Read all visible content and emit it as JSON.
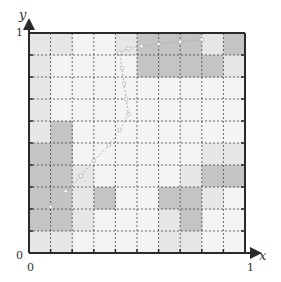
{
  "figure": {
    "x_axis": {
      "label": "x",
      "min_label": "0",
      "max_label": "1"
    },
    "y_axis": {
      "label": "y",
      "min_label": "0",
      "max_label": "1"
    },
    "grid": {
      "cols": 10,
      "rows": 10,
      "line_style": "dashed"
    },
    "colors": {
      "frame": "#2a2a2a",
      "grid_line": "#444444",
      "shade_light": "#e6e6e6",
      "shade_mid": "#c4c4c4",
      "shade_dark": "#aaaaaa",
      "background_cell": "#f4f4f4",
      "trajectory": "#b0b0b0"
    },
    "cells": [
      {
        "r": 0,
        "c": 4,
        "level": "light"
      },
      {
        "r": 0,
        "c": 5,
        "level": "mid"
      },
      {
        "r": 0,
        "c": 6,
        "level": "mid"
      },
      {
        "r": 0,
        "c": 7,
        "level": "mid"
      },
      {
        "r": 0,
        "c": 8,
        "level": "light"
      },
      {
        "r": 0,
        "c": 9,
        "level": "mid"
      },
      {
        "r": 1,
        "c": 5,
        "level": "mid"
      },
      {
        "r": 1,
        "c": 6,
        "level": "mid"
      },
      {
        "r": 1,
        "c": 7,
        "level": "mid"
      },
      {
        "r": 1,
        "c": 8,
        "level": "mid"
      },
      {
        "r": 1,
        "c": 9,
        "level": "light"
      },
      {
        "r": 0,
        "c": 0,
        "level": "light"
      },
      {
        "r": 0,
        "c": 1,
        "level": "light"
      },
      {
        "r": 1,
        "c": 0,
        "level": "light"
      },
      {
        "r": 2,
        "c": 0,
        "level": "light"
      },
      {
        "r": 3,
        "c": 0,
        "level": "light"
      },
      {
        "r": 4,
        "c": 0,
        "level": "light"
      },
      {
        "r": 4,
        "c": 1,
        "level": "mid"
      },
      {
        "r": 5,
        "c": 0,
        "level": "mid"
      },
      {
        "r": 5,
        "c": 1,
        "level": "mid"
      },
      {
        "r": 5,
        "c": 8,
        "level": "light"
      },
      {
        "r": 5,
        "c": 9,
        "level": "light"
      },
      {
        "r": 6,
        "c": 0,
        "level": "mid"
      },
      {
        "r": 6,
        "c": 1,
        "level": "mid"
      },
      {
        "r": 6,
        "c": 2,
        "level": "light"
      },
      {
        "r": 6,
        "c": 7,
        "level": "light"
      },
      {
        "r": 6,
        "c": 8,
        "level": "mid"
      },
      {
        "r": 6,
        "c": 9,
        "level": "mid"
      },
      {
        "r": 7,
        "c": 0,
        "level": "mid"
      },
      {
        "r": 7,
        "c": 1,
        "level": "mid"
      },
      {
        "r": 7,
        "c": 2,
        "level": "light"
      },
      {
        "r": 7,
        "c": 3,
        "level": "mid"
      },
      {
        "r": 7,
        "c": 6,
        "level": "mid"
      },
      {
        "r": 7,
        "c": 7,
        "level": "mid"
      },
      {
        "r": 7,
        "c": 8,
        "level": "light"
      },
      {
        "r": 8,
        "c": 0,
        "level": "mid"
      },
      {
        "r": 8,
        "c": 1,
        "level": "mid"
      },
      {
        "r": 8,
        "c": 2,
        "level": "light"
      },
      {
        "r": 8,
        "c": 6,
        "level": "light"
      },
      {
        "r": 8,
        "c": 7,
        "level": "mid"
      },
      {
        "r": 9,
        "c": 0,
        "level": "light"
      },
      {
        "r": 9,
        "c": 1,
        "level": "light"
      },
      {
        "r": 9,
        "c": 6,
        "level": "light"
      },
      {
        "r": 9,
        "c": 7,
        "level": "light"
      }
    ],
    "trajectory": [
      [
        0.1,
        0.21
      ],
      [
        0.17,
        0.28
      ],
      [
        0.24,
        0.35
      ],
      [
        0.3,
        0.42
      ],
      [
        0.37,
        0.49
      ],
      [
        0.42,
        0.56
      ],
      [
        0.46,
        0.63
      ],
      [
        0.45,
        0.7
      ],
      [
        0.44,
        0.77
      ],
      [
        0.43,
        0.84
      ],
      [
        0.42,
        0.91
      ],
      [
        0.46,
        0.93
      ],
      [
        0.52,
        0.94
      ],
      [
        0.6,
        0.95
      ],
      [
        0.7,
        0.96
      ],
      [
        0.8,
        0.97
      ]
    ]
  }
}
